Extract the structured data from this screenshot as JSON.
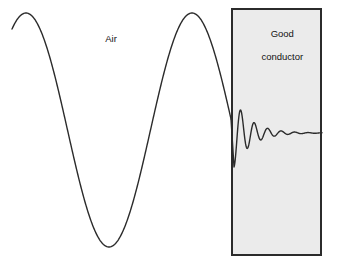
{
  "figure": {
    "background_color": "#ffffff",
    "width": 337,
    "height": 269
  },
  "labels": {
    "air": "Air",
    "conductor_line1": "Good",
    "conductor_line2": "conductor"
  },
  "regions": {
    "air": {
      "name": "Air",
      "fill_color": "#ffffff",
      "x_start": 0,
      "x_end": 231
    },
    "conductor": {
      "name": "Good conductor",
      "fill_color": "#ebebeb",
      "border_color": "#2b2b2b",
      "border_width": 2,
      "x": 231,
      "y": 8,
      "width": 91,
      "height": 248
    }
  },
  "curve": {
    "color": "#2b2b2b",
    "stroke_width": 1.4,
    "centerline_air": 130,
    "centerline_conductor": 133,
    "amplitude_air": 117,
    "wavelength_air": 166,
    "x_start": 12,
    "interface_x": 231,
    "attenuation_length": 17,
    "wavelength_conductor": 13.5,
    "x_end": 322
  },
  "chart_data": {
    "type": "line",
    "xlabel": "",
    "ylabel": "",
    "grid": false,
    "legend": null,
    "annotations": [
      {
        "text": "Air",
        "x": 105,
        "y": 29
      },
      {
        "text": "Good conductor",
        "x": 277,
        "y": 33
      }
    ],
    "series": [
      {
        "name": "incident wave in air",
        "description": "Undamped sinusoid of constant amplitude travelling through air",
        "centerline_y": 130,
        "amplitude": 117,
        "wavelength": 166,
        "x_range": [
          12,
          231
        ],
        "key_points": [
          {
            "x": 12,
            "y": 27,
            "label": "start"
          },
          {
            "x": 26,
            "y": 13,
            "label": "peak 1"
          },
          {
            "x": 67,
            "y": 130,
            "label": "zero crossing"
          },
          {
            "x": 108,
            "y": 247,
            "label": "trough"
          },
          {
            "x": 150,
            "y": 130,
            "label": "zero crossing"
          },
          {
            "x": 192,
            "y": 13,
            "label": "peak 2"
          },
          {
            "x": 231,
            "y": 118,
            "label": "interface"
          }
        ]
      },
      {
        "name": "transmitted wave in conductor",
        "description": "Exponentially damped sinusoid decaying with skin depth inside the good conductor",
        "centerline_y": 133,
        "amplitude_at_interface": 36,
        "wavelength": 13.5,
        "attenuation_length": 17,
        "x_range": [
          231,
          322
        ],
        "key_points": [
          {
            "x": 234,
            "y": 167,
            "label": "first minimum"
          },
          {
            "x": 240,
            "y": 107,
            "label": "first maximum"
          },
          {
            "x": 247,
            "y": 152,
            "label": "second minimum"
          },
          {
            "x": 254,
            "y": 116,
            "label": "second maximum"
          },
          {
            "x": 261,
            "y": 146,
            "label": "third minimum"
          },
          {
            "x": 268,
            "y": 121,
            "label": "third maximum"
          },
          {
            "x": 282,
            "y": 127,
            "label": "decaying"
          },
          {
            "x": 300,
            "y": 131,
            "label": "nearly flat"
          },
          {
            "x": 322,
            "y": 133,
            "label": "fully attenuated"
          }
        ]
      }
    ]
  }
}
